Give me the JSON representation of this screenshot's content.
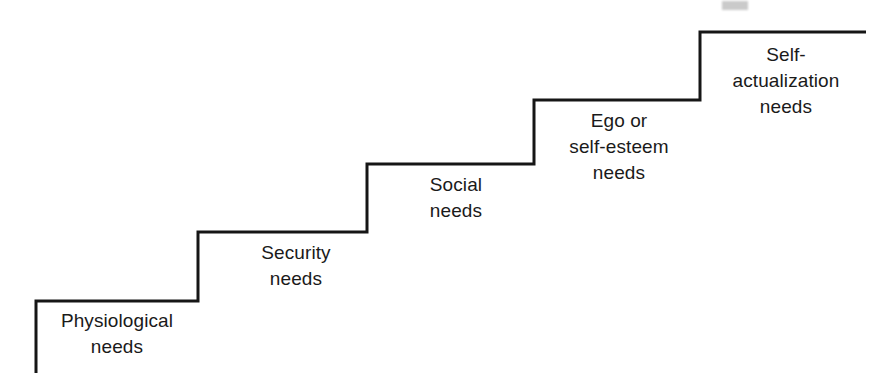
{
  "diagram": {
    "type": "staircase",
    "line_color": "#161616",
    "line_width_px": 3,
    "background_color": "#ffffff",
    "text_color": "#1a1a1a",
    "steps": [
      {
        "index": 1,
        "id": "physiological",
        "label": "Physiological\nneeds",
        "lines": [
          "Physiological",
          "needs"
        ],
        "level": "lowest"
      },
      {
        "index": 2,
        "id": "security",
        "label": "Security\nneeds",
        "lines": [
          "Security",
          "needs"
        ],
        "level": "second"
      },
      {
        "index": 3,
        "id": "social",
        "label": "Social\nneeds",
        "lines": [
          "Social",
          "needs"
        ],
        "level": "third"
      },
      {
        "index": 4,
        "id": "ego-self-esteem",
        "label": "Ego or\nself-esteem\nneeds",
        "lines": [
          "Ego or",
          "self-esteem",
          "needs"
        ],
        "level": "fourth"
      },
      {
        "index": 5,
        "id": "self-actualization",
        "label": "Self-\nactualization\nneeds",
        "lines": [
          "Self-",
          "actualization",
          "needs"
        ],
        "level": "highest"
      }
    ],
    "path": "M 36 373 L 36 301 L 198 301 L 198 232 L 367 232 L 367 164 L 534 164 L 534 100 L 700 100 L 700 32 L 866 32"
  }
}
